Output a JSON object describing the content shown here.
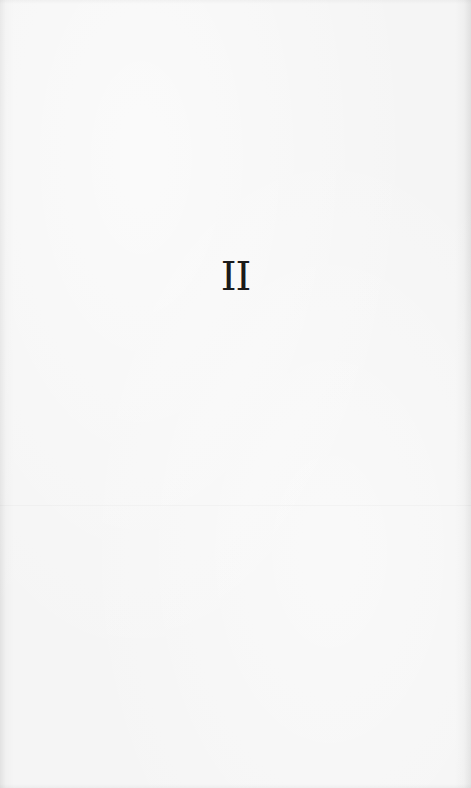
{
  "page": {
    "heading": "II",
    "colors": {
      "paper": "#f4f4f4",
      "ink": "#1a1a1a"
    }
  }
}
